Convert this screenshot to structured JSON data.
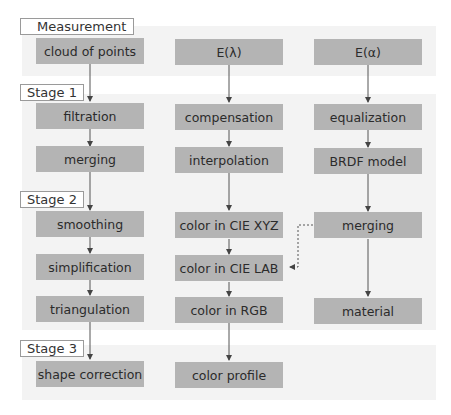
{
  "stages": [
    {
      "label": "Measurement"
    },
    {
      "label": "Stage 1"
    },
    {
      "label": "Stage 2"
    },
    {
      "label": "Stage 3"
    }
  ],
  "columns": [
    {
      "name": "geometry",
      "nodes": [
        "cloud of points",
        "filtration",
        "merging",
        "smoothing",
        "simplification",
        "triangulation",
        "shape correction"
      ]
    },
    {
      "name": "color",
      "nodes": [
        "E(λ)",
        "compensation",
        "interpolation",
        "color in CIE XYZ",
        "color in CIE LAB",
        "color in RGB",
        "color profile"
      ]
    },
    {
      "name": "reflectance",
      "nodes": [
        "E(α)",
        "equalization",
        "BRDF model",
        "merging",
        "material"
      ]
    }
  ],
  "edges": [
    {
      "from": "cloud of points",
      "to": "filtration",
      "style": "solid"
    },
    {
      "from": "filtration",
      "to": "merging",
      "style": "solid"
    },
    {
      "from": "merging",
      "to": "smoothing",
      "style": "solid"
    },
    {
      "from": "smoothing",
      "to": "simplification",
      "style": "solid"
    },
    {
      "from": "simplification",
      "to": "triangulation",
      "style": "solid"
    },
    {
      "from": "triangulation",
      "to": "shape correction",
      "style": "solid"
    },
    {
      "from": "E(λ)",
      "to": "compensation",
      "style": "solid"
    },
    {
      "from": "compensation",
      "to": "interpolation",
      "style": "solid"
    },
    {
      "from": "interpolation",
      "to": "color in CIE XYZ",
      "style": "solid"
    },
    {
      "from": "color in CIE XYZ",
      "to": "color in CIE LAB",
      "style": "solid"
    },
    {
      "from": "color in CIE LAB",
      "to": "color in RGB",
      "style": "solid"
    },
    {
      "from": "color in RGB",
      "to": "color profile",
      "style": "solid"
    },
    {
      "from": "E(α)",
      "to": "equalization",
      "style": "solid"
    },
    {
      "from": "equalization",
      "to": "BRDF model",
      "style": "solid"
    },
    {
      "from": "BRDF model",
      "to": "merging (reflectance)",
      "style": "solid"
    },
    {
      "from": "merging (reflectance)",
      "to": "material",
      "style": "solid"
    },
    {
      "from": "merging (reflectance)",
      "to": "color in CIE LAB",
      "style": "dotted"
    }
  ],
  "colors": {
    "node_fill": "#b4b4b4",
    "panel_fill": "#f3f3f3",
    "stage_border": "#9a9a9a",
    "arrow": "#444444"
  }
}
